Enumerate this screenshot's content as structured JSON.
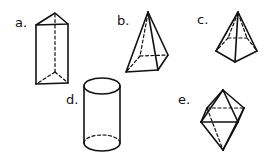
{
  "figures": [
    {
      "label": "a.",
      "shape": "triangular-prism"
    },
    {
      "label": "b.",
      "shape": "square-pyramid"
    },
    {
      "label": "c.",
      "shape": "pentagonal-pyramid"
    },
    {
      "label": "d.",
      "shape": "cylinder"
    },
    {
      "label": "e.",
      "shape": "octahedron"
    }
  ],
  "colors": {
    "ink": "#111111",
    "background": "#ffffff"
  }
}
